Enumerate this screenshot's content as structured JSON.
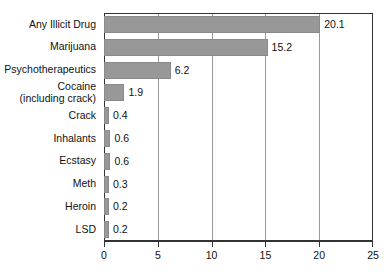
{
  "chart_data": {
    "type": "bar",
    "orientation": "horizontal",
    "title": "",
    "xlabel": "",
    "ylabel": "",
    "xlim": [
      0,
      25
    ],
    "xticks": [
      "0",
      "5",
      "10",
      "15",
      "20",
      "25"
    ],
    "gridlines": [
      5,
      10,
      15,
      20
    ],
    "grid": true,
    "legend": "none",
    "bar_color": "#989898",
    "axis_color": "#333333",
    "grid_color": "#9a9a9a",
    "categories": [
      "Any Illicit Drug",
      "Marijuana",
      "Psychotherapeutics",
      "Cocaine (including crack)",
      "Crack",
      "Inhalants",
      "Ecstasy",
      "Meth",
      "Heroin",
      "LSD"
    ],
    "category_lines": [
      [
        "Any Illicit Drug"
      ],
      [
        "Marijuana"
      ],
      [
        "Psychotherapeutics"
      ],
      [
        "Cocaine",
        "(including crack)"
      ],
      [
        "Crack"
      ],
      [
        "Inhalants"
      ],
      [
        "Ecstasy"
      ],
      [
        "Meth"
      ],
      [
        "Heroin"
      ],
      [
        "LSD"
      ]
    ],
    "values": [
      20.1,
      15.2,
      6.2,
      1.9,
      0.4,
      0.6,
      0.6,
      0.3,
      0.2,
      0.2
    ],
    "value_labels": [
      "20.1",
      "15.2",
      "6.2",
      "1.9",
      "0.4",
      "0.6",
      "0.6",
      "0.3",
      "0.2",
      "0.2"
    ]
  }
}
